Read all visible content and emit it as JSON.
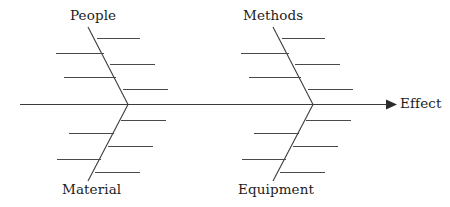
{
  "diagram": {
    "type": "fishbone-ishikawa-cause-and-effect",
    "title": "",
    "colors": {
      "line": "#3b3b3b",
      "rib": "#4a4a4a",
      "arrow": "#2b2b2b",
      "text": "#1c1c1c",
      "background": "#ffffff"
    },
    "spine": {
      "label": "Effect",
      "x_start": 20,
      "x_end": 392,
      "y": 104,
      "arrow": "right-triangle-arrowhead"
    },
    "categories": [
      {
        "id": "people",
        "label": "People",
        "position": "top-left",
        "vertex_x": 128,
        "vertex_y": 104,
        "tip_x": 88,
        "tip_y": 27,
        "rib_count": 4
      },
      {
        "id": "methods",
        "label": "Methods",
        "position": "top-right",
        "vertex_x": 313,
        "vertex_y": 104,
        "tip_x": 273,
        "tip_y": 27,
        "rib_count": 4
      },
      {
        "id": "material",
        "label": "Material",
        "position": "bottom-left",
        "vertex_x": 128,
        "vertex_y": 104,
        "tip_x": 88,
        "tip_y": 181,
        "rib_count": 4
      },
      {
        "id": "equipment",
        "label": "Equipment",
        "position": "bottom-right",
        "vertex_x": 313,
        "vertex_y": 104,
        "tip_x": 273,
        "tip_y": 181,
        "rib_count": 4
      }
    ],
    "ribs": {
      "people": [
        {
          "side": "right",
          "y": 38,
          "x_from": 96,
          "x_to": 140
        },
        {
          "side": "left",
          "y": 53,
          "x_from": 56,
          "x_to": 104
        },
        {
          "side": "right",
          "y": 64,
          "x_from": 110,
          "x_to": 155
        },
        {
          "side": "left",
          "y": 77,
          "x_from": 64,
          "x_to": 116
        },
        {
          "side": "right",
          "y": 89,
          "x_from": 123,
          "x_to": 168
        }
      ],
      "methods": [
        {
          "side": "right",
          "y": 38,
          "x_from": 281,
          "x_to": 325
        },
        {
          "side": "left",
          "y": 53,
          "x_from": 241,
          "x_to": 289
        },
        {
          "side": "right",
          "y": 64,
          "x_from": 295,
          "x_to": 340
        },
        {
          "side": "left",
          "y": 77,
          "x_from": 249,
          "x_to": 301
        },
        {
          "side": "right",
          "y": 89,
          "x_from": 308,
          "x_to": 353
        }
      ],
      "material": [
        {
          "side": "right",
          "y": 120,
          "x_from": 121,
          "x_to": 166
        },
        {
          "side": "left",
          "y": 133,
          "x_from": 69,
          "x_to": 114
        },
        {
          "side": "right",
          "y": 146,
          "x_from": 108,
          "x_to": 153
        },
        {
          "side": "left",
          "y": 159,
          "x_from": 57,
          "x_to": 101
        },
        {
          "side": "right",
          "y": 172,
          "x_from": 95,
          "x_to": 140
        }
      ],
      "equipment": [
        {
          "side": "right",
          "y": 120,
          "x_from": 306,
          "x_to": 351
        },
        {
          "side": "left",
          "y": 133,
          "x_from": 254,
          "x_to": 299
        },
        {
          "side": "right",
          "y": 146,
          "x_from": 293,
          "x_to": 338
        },
        {
          "side": "left",
          "y": 159,
          "x_from": 242,
          "x_to": 286
        },
        {
          "side": "right",
          "y": 172,
          "x_from": 280,
          "x_to": 325
        }
      ]
    }
  }
}
